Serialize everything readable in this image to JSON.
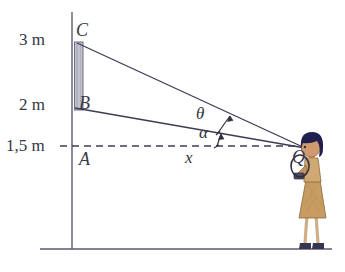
{
  "figure": {
    "type": "geometry-diagram",
    "labels": {
      "height_top": "3 m",
      "height_mid": "2 m",
      "height_eye": "1,5 m",
      "point_c": "C",
      "point_b": "B",
      "point_a": "A",
      "point_q": "Q",
      "angle_theta": "θ",
      "angle_alpha": "α",
      "distance_x": "x"
    },
    "colors": {
      "line": "#3c3c55",
      "axis": "#6b6b80",
      "dashed": "#3c3c55",
      "ground": "#5a5a72",
      "bar_fill": "#b9b9c4",
      "hair": "#20204f",
      "dress": "#c89f66",
      "skin": "#c98f63",
      "shoe": "#33334d",
      "text": "#35353f"
    },
    "geometry": {
      "axis_x": 72,
      "axis_top_y": 12,
      "ground_y": 249,
      "ground_x_start": 40,
      "ground_x_end": 332,
      "point_c": [
        77,
        43
      ],
      "point_b": [
        75,
        108
      ],
      "point_a": [
        73,
        146
      ],
      "point_q": [
        305,
        148
      ],
      "dashed_y": 146,
      "dashed_x_start": 73,
      "dashed_x_end": 305,
      "bar_x": 74,
      "bar_width": 9,
      "bar_top_y": 42,
      "bar_bottom_y": 110
    }
  }
}
